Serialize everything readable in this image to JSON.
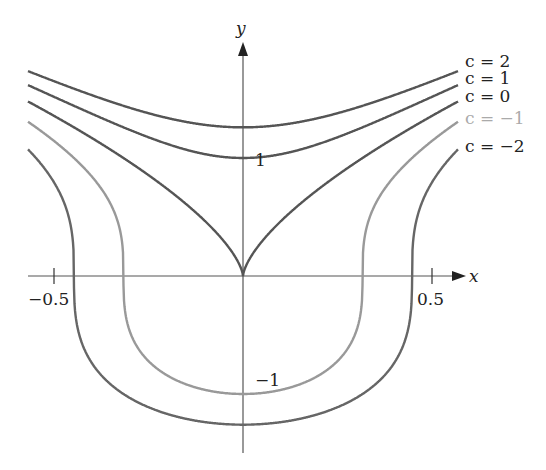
{
  "chart_data": {
    "type": "line",
    "title": "",
    "xlabel": "x",
    "ylabel": "y",
    "xlim": [
      -0.57,
      0.57
    ],
    "ylim": [
      -1.5,
      2.3
    ],
    "x_ticks": [
      {
        "value": -0.5,
        "label": "−0.5"
      },
      {
        "value": 0.5,
        "label": "0.5"
      }
    ],
    "y_ticks": [
      {
        "value": 1,
        "label": "1"
      },
      {
        "value": -1,
        "label": "−1"
      }
    ],
    "grid": false,
    "legend_position": "right (inline labels at curve ends)",
    "relation": "y^3 = 10 x^2 + c",
    "series": [
      {
        "name": "c = 2",
        "c": 2,
        "color": "#555555",
        "y_at_x0": 1.26
      },
      {
        "name": "c = 1",
        "c": 1,
        "color": "#555555",
        "y_at_x0": 1.0
      },
      {
        "name": "c = 0",
        "c": 0,
        "color": "#555555",
        "y_at_x0": 0.0
      },
      {
        "name": "c = −1",
        "c": -1,
        "color": "#999999",
        "y_at_x0": -1.0
      },
      {
        "name": "c = −2",
        "c": -2,
        "color": "#666666",
        "y_at_x0": -1.26
      }
    ]
  },
  "labels": {
    "x_axis": "x",
    "y_axis": "y",
    "tick_x_neg": "−0.5",
    "tick_x_pos": "0.5",
    "tick_y_pos": "1",
    "tick_y_neg": "−1",
    "c2": "c = 2",
    "c1": "c = 1",
    "c0": "c = 0",
    "cm1": "c = −1",
    "cm2": "c = −2"
  }
}
